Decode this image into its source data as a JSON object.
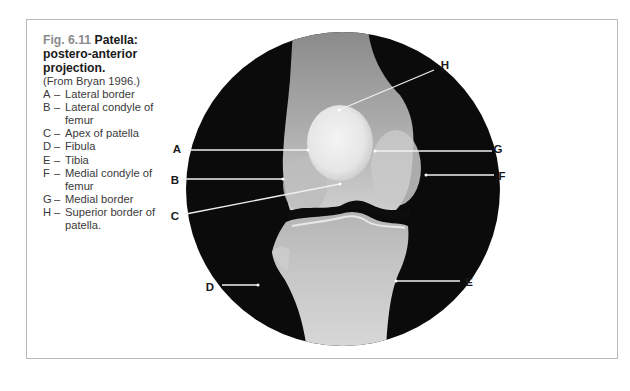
{
  "figure": {
    "number": "Fig. 6.11",
    "title": "Patella: postero-anterior projection.",
    "source": "(From Bryan 1996.)",
    "legend": [
      {
        "letter": "A",
        "dash": "–",
        "text": "Lateral border"
      },
      {
        "letter": "B",
        "dash": "–",
        "text": "Lateral condyle of femur"
      },
      {
        "letter": "C",
        "dash": "–",
        "text": "Apex of patella"
      },
      {
        "letter": "D",
        "dash": "–",
        "text": "Fibula"
      },
      {
        "letter": "E",
        "dash": "–",
        "text": "Tibia"
      },
      {
        "letter": "F",
        "dash": "–",
        "text": "Medial condyle of femur"
      },
      {
        "letter": "G",
        "dash": "–",
        "text": "Medial border"
      },
      {
        "letter": "H",
        "dash": "–",
        "text": "Superior border of patella."
      }
    ]
  },
  "image_labels": {
    "A": "A",
    "B": "B",
    "C": "C",
    "D": "D",
    "E": "E",
    "F": "F",
    "G": "G",
    "H": "H"
  },
  "colors": {
    "frame_border": "#b9b9b9",
    "xray_background": "#0b0b0b",
    "bone": "#d9d9d9",
    "pointer_line": "#f0f0f0"
  }
}
